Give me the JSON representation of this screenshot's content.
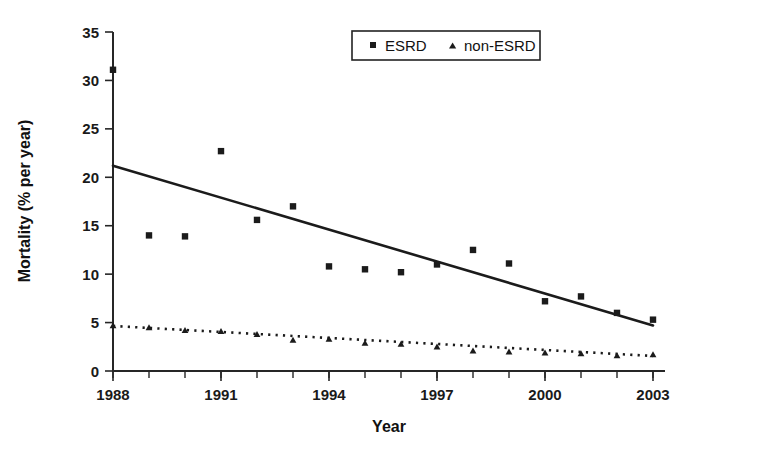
{
  "chart_data": {
    "type": "scatter",
    "title": "",
    "xlabel": "Year",
    "ylabel": "Mortality (% per year)",
    "xlim": [
      1988,
      2003
    ],
    "ylim": [
      0,
      35
    ],
    "yticks": [
      "0",
      "5",
      "10",
      "15",
      "20",
      "25",
      "30",
      "35"
    ],
    "ytick_values": [
      0,
      5,
      10,
      15,
      20,
      25,
      30,
      35
    ],
    "xticks": [
      "1988",
      "1991",
      "1994",
      "1997",
      "2000",
      "2003"
    ],
    "xtick_values": [
      1988,
      1991,
      1994,
      1997,
      2000,
      2003
    ],
    "x_minor_step": 1,
    "grid": false,
    "legend_position": "top-center",
    "x": [
      1988,
      1989,
      1990,
      1991,
      1992,
      1993,
      1994,
      1995,
      1996,
      1997,
      1998,
      1999,
      2000,
      2001,
      2002,
      2003
    ],
    "series": [
      {
        "name": "ESRD",
        "marker": "square",
        "color": "#1b1b1b",
        "values": [
          31.1,
          14.0,
          13.9,
          22.7,
          15.6,
          17.0,
          10.8,
          10.5,
          10.2,
          11.0,
          12.5,
          11.1,
          7.2,
          7.7,
          6.0,
          5.3
        ],
        "trendline": {
          "style": "solid",
          "x": [
            1988,
            2003
          ],
          "y": [
            21.2,
            4.7
          ]
        }
      },
      {
        "name": "non-ESRD",
        "marker": "triangle",
        "color": "#1b1b1b",
        "values": [
          4.7,
          4.5,
          4.2,
          4.1,
          3.8,
          3.2,
          3.3,
          2.9,
          2.8,
          2.5,
          2.1,
          2.0,
          1.9,
          1.8,
          1.6,
          1.7
        ],
        "trendline": {
          "style": "dotted",
          "x": [
            1988,
            2003
          ],
          "y": [
            4.65,
            1.55
          ]
        }
      }
    ],
    "legend": [
      {
        "label": "ESRD",
        "marker": "square"
      },
      {
        "label": "non-ESRD",
        "marker": "triangle"
      }
    ]
  },
  "axes": {
    "y_title": "Mortality (% per year)",
    "x_title": "Year"
  },
  "legend": {
    "esrd_label": "ESRD",
    "nonesrd_label": "non-ESRD"
  }
}
